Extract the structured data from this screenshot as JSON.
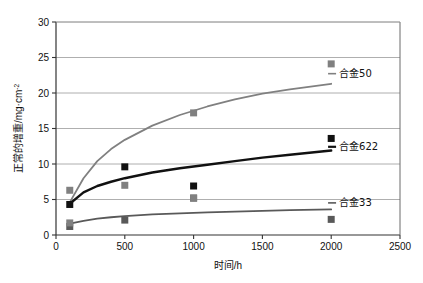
{
  "chart_data": {
    "type": "scatter",
    "title": "",
    "xlabel": "时间/h",
    "ylabel": "正常的增重/mg·cm",
    "ylabel_sup": "-2",
    "xlim": [
      0,
      2500
    ],
    "ylim": [
      0,
      30
    ],
    "xticks": [
      0,
      500,
      1000,
      1500,
      2000,
      2500
    ],
    "yticks": [
      0,
      5,
      10,
      15,
      20,
      25,
      30
    ],
    "xtick_labels": [
      "0",
      "500",
      "1000",
      "1500",
      "2000",
      "2500"
    ],
    "ytick_labels": [
      "0",
      "5",
      "10",
      "15",
      "20",
      "25",
      "30"
    ],
    "grid": "horizontal",
    "legend_position": "inline-right",
    "x": [
      100,
      500,
      1000,
      2000
    ],
    "series": [
      {
        "name": "合金50",
        "color": "#808080",
        "marker": "square",
        "values": [
          6.3,
          7.0,
          17.2,
          24.1
        ],
        "fit_curve": [
          [
            100,
            4.6
          ],
          [
            200,
            8.0
          ],
          [
            300,
            10.4
          ],
          [
            400,
            12.1
          ],
          [
            500,
            13.4
          ],
          [
            700,
            15.4
          ],
          [
            900,
            16.9
          ],
          [
            1100,
            18.1
          ],
          [
            1300,
            19.1
          ],
          [
            1500,
            19.9
          ],
          [
            1700,
            20.5
          ],
          [
            2000,
            21.3
          ]
        ],
        "label_x": 2050,
        "label_y": 22.3
      },
      {
        "name": "合金622",
        "color": "#111111",
        "marker": "square",
        "values": [
          4.3,
          9.6,
          6.9,
          13.6
        ],
        "fit_curve": [
          [
            100,
            4.4
          ],
          [
            200,
            6.0
          ],
          [
            300,
            6.9
          ],
          [
            400,
            7.5
          ],
          [
            500,
            8.0
          ],
          [
            700,
            8.8
          ],
          [
            900,
            9.4
          ],
          [
            1100,
            9.9
          ],
          [
            1300,
            10.4
          ],
          [
            1500,
            10.9
          ],
          [
            1700,
            11.3
          ],
          [
            2000,
            11.9
          ]
        ],
        "label_x": 2050,
        "label_y": 12.0
      },
      {
        "name": "合金33",
        "color": "#595959",
        "marker": "square",
        "values": [
          1.2,
          2.1,
          5.2,
          2.2
        ],
        "fit_curve": [
          [
            100,
            1.6
          ],
          [
            200,
            2.0
          ],
          [
            300,
            2.3
          ],
          [
            400,
            2.5
          ],
          [
            500,
            2.65
          ],
          [
            700,
            2.9
          ],
          [
            900,
            3.05
          ],
          [
            1100,
            3.2
          ],
          [
            1300,
            3.3
          ],
          [
            1500,
            3.4
          ],
          [
            1700,
            3.5
          ],
          [
            2000,
            3.6
          ]
        ],
        "label_x": 2050,
        "label_y": 4.1
      }
    ],
    "extra_points": [
      {
        "x": 100,
        "y": 1.7,
        "color": "#808080"
      },
      {
        "x": 1000,
        "y": 5.2,
        "color": "#808080"
      }
    ],
    "colors": {
      "series1": "#808080",
      "series2": "#111111",
      "series3": "#595959",
      "grid": "#9a9a9a",
      "axis": "#4a4a4a",
      "background": "#ffffff"
    }
  }
}
